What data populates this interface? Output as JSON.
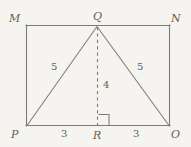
{
  "figure": {
    "type": "geometry-diagram",
    "background_color": "#f6f4f1",
    "line_color": "#7b7b7b",
    "label_color": "#5e5e5e",
    "vertex_labels": [
      {
        "id": "M",
        "text": "M",
        "x": 9,
        "y": 13
      },
      {
        "id": "Q",
        "text": "Q",
        "x": 93,
        "y": 11
      },
      {
        "id": "N",
        "text": "N",
        "x": 171,
        "y": 13
      },
      {
        "id": "P",
        "text": "P",
        "x": 11,
        "y": 129
      },
      {
        "id": "R",
        "text": "R",
        "x": 93,
        "y": 130
      },
      {
        "id": "O",
        "text": "O",
        "x": 171,
        "y": 129
      }
    ],
    "measure_labels": [
      {
        "id": "PQ",
        "text": "5",
        "x": 51,
        "y": 62
      },
      {
        "id": "QO",
        "text": "5",
        "x": 137,
        "y": 62
      },
      {
        "id": "QR",
        "text": "4",
        "x": 103,
        "y": 80
      },
      {
        "id": "PR",
        "text": "3",
        "x": 61,
        "y": 129
      },
      {
        "id": "RO",
        "text": "3",
        "x": 133,
        "y": 129
      }
    ],
    "geometry": {
      "rectangle": {
        "left": 26,
        "top": 25,
        "right": 170,
        "bottom": 126
      },
      "apex": {
        "x": 97,
        "y": 26
      },
      "foot": {
        "x": 97,
        "y": 126
      },
      "right_angle_marker": {
        "x": 98,
        "y": 115,
        "size": 11
      }
    }
  }
}
